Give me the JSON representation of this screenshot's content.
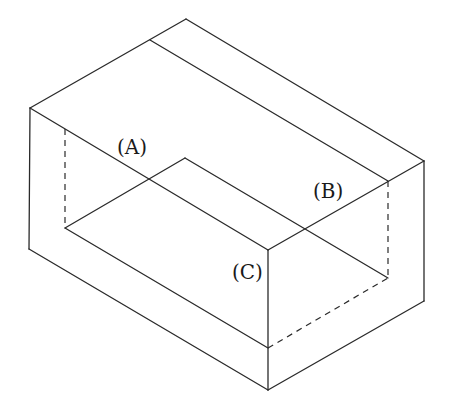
{
  "diagram": {
    "type": "isometric-solid",
    "labels": [
      {
        "id": "A",
        "text": "(A)",
        "x": 117,
        "y": 137
      },
      {
        "id": "B",
        "text": "(B)",
        "x": 313,
        "y": 181
      },
      {
        "id": "C",
        "text": "(C)",
        "x": 232,
        "y": 262
      }
    ],
    "colors": {
      "line": "#2a2a2a",
      "background": "#ffffff"
    },
    "visible_edges": [
      [
        [
          186,
          19
        ],
        [
          30,
          108
        ]
      ],
      [
        [
          186,
          19
        ],
        [
          424,
          161
        ]
      ],
      [
        [
          150,
          40
        ],
        [
          388,
          181
        ]
      ],
      [
        [
          30,
          108
        ],
        [
          268,
          250
        ]
      ],
      [
        [
          268,
          250
        ],
        [
          424,
          161
        ]
      ],
      [
        [
          30,
          108
        ],
        [
          29,
          249
        ]
      ],
      [
        [
          29,
          249
        ],
        [
          268,
          390
        ]
      ],
      [
        [
          268,
          250
        ],
        [
          268,
          390
        ]
      ],
      [
        [
          424,
          161
        ],
        [
          424,
          301
        ]
      ],
      [
        [
          268,
          390
        ],
        [
          424,
          301
        ]
      ],
      [
        [
          65,
          228
        ],
        [
          185,
          158
        ]
      ],
      [
        [
          185,
          158
        ],
        [
          388,
          278
        ]
      ],
      [
        [
          65,
          228
        ],
        [
          268,
          348
        ]
      ]
    ],
    "hidden_edges": [
      [
        [
          65,
          129
        ],
        [
          65,
          228
        ]
      ],
      [
        [
          388,
          181
        ],
        [
          388,
          278
        ]
      ],
      [
        [
          268,
          348
        ],
        [
          388,
          278
        ]
      ]
    ]
  }
}
